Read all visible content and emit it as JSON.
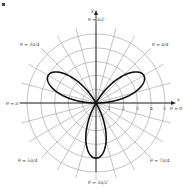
{
  "chart_data": {
    "type": "line",
    "subtype": "polar",
    "title": "",
    "equation": "r = 4 sin(3θ)",
    "curve": {
      "name": "three-petal rose",
      "amplitude": 4,
      "petals": 3,
      "petal_angles": [
        "π/6",
        "5π/6",
        "3π/2"
      ],
      "theta_range": [
        0,
        3.14159
      ],
      "color": "#111111"
    },
    "radial_ticks": [
      1,
      2,
      3,
      4,
      5
    ],
    "r_max": 5,
    "angle_labels": [
      {
        "text": "θ = π/2",
        "angle_deg": 90
      },
      {
        "text": "θ = π/4",
        "angle_deg": 45
      },
      {
        "text": "θ = 3π/4",
        "angle_deg": 135
      },
      {
        "text": "θ = π",
        "angle_deg": 180
      },
      {
        "text": "θ = 0",
        "angle_deg": 0
      },
      {
        "text": "θ = 5π/4",
        "angle_deg": 225
      },
      {
        "text": "θ = 7π/4",
        "angle_deg": 315
      },
      {
        "text": "θ = 3π/2",
        "angle_deg": 270
      }
    ],
    "axes": {
      "x_label": "x",
      "y_label": "y"
    },
    "grid": {
      "circles": true,
      "radial_lines_every_deg": 15
    },
    "grid_color": "#9a9a9a"
  },
  "labels": {
    "y_axis": "y",
    "x_axis": "x",
    "theta_top": "θ = π/2",
    "theta_tr": "θ = π/4",
    "theta_tl": "θ = 3π/4",
    "theta_left": "θ = π",
    "theta_right": "θ = 0",
    "theta_bl": "θ = 5π/4",
    "theta_br": "θ = 7π/4",
    "theta_bottom": "θ = 3π/2",
    "tick_1": "1",
    "tick_2": "2",
    "tick_3": "3",
    "tick_4": "4",
    "tick_5": "5"
  }
}
